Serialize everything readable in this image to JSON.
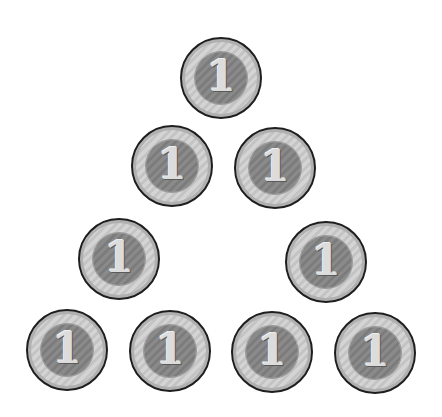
{
  "scene": {
    "description": "Ten coins arranged in a triangle outline (4 rows)",
    "background": "#ffffff",
    "coin_colors": {
      "rim": "#1e1e1e",
      "outer": "#cccccc",
      "inner": "#848484",
      "digit": "#dcdcdc"
    }
  },
  "coins": [
    {
      "label": "1",
      "row": 1,
      "cx": 221,
      "cy": 78
    },
    {
      "label": "1",
      "row": 2,
      "cx": 172,
      "cy": 166
    },
    {
      "label": "1",
      "row": 2,
      "cx": 275,
      "cy": 168
    },
    {
      "label": "1",
      "row": 3,
      "cx": 119,
      "cy": 259
    },
    {
      "label": "1",
      "row": 3,
      "cx": 326,
      "cy": 262
    },
    {
      "label": "1",
      "row": 4,
      "cx": 67,
      "cy": 350
    },
    {
      "label": "1",
      "row": 4,
      "cx": 170,
      "cy": 351
    },
    {
      "label": "1",
      "row": 4,
      "cx": 272,
      "cy": 352
    },
    {
      "label": "1",
      "row": 4,
      "cx": 375,
      "cy": 353
    }
  ]
}
